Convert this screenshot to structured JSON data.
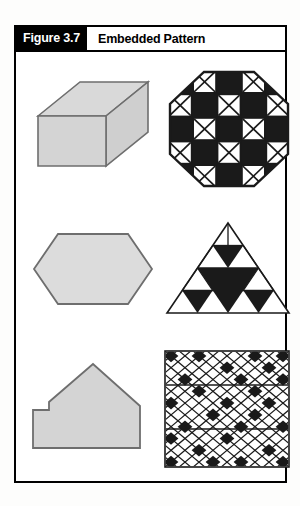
{
  "figure": {
    "number_label": "Figure 3.7",
    "title": "Embedded Pattern",
    "frame_border_color": "#000000",
    "page_background": "#fdfdfc"
  },
  "colors": {
    "ink": "#000000",
    "paper": "#ffffff",
    "shape_fill": "#d4d4d4",
    "shape_fill_light": "#dcdcdc",
    "shape_stroke": "#6e6e6e",
    "pattern_dark": "#1a1a1a",
    "pattern_light": "#ffffff"
  },
  "left_column": {
    "items": [
      {
        "name": "rectangular-box",
        "label": "3D rectangular box",
        "fill": "#d4d4d4"
      },
      {
        "name": "elongated-hexagon",
        "label": "Elongated hexagon",
        "fill": "#dcdcdc"
      },
      {
        "name": "house-pentagon",
        "label": "House-shaped pentagon",
        "fill": "#d4d4d4"
      }
    ]
  },
  "right_column": {
    "items": [
      {
        "name": "octagon-checkerboard",
        "label": "Octagon checkerboard with X cells",
        "grid_size": 5,
        "cells": [
          [
            1,
            0,
            1,
            0,
            1
          ],
          [
            0,
            1,
            0,
            1,
            0
          ],
          [
            1,
            0,
            1,
            0,
            1
          ],
          [
            0,
            1,
            0,
            1,
            0
          ],
          [
            1,
            0,
            1,
            0,
            1
          ]
        ],
        "dark_value": 1,
        "x_value": 0
      },
      {
        "name": "sierpinski-triangle",
        "label": "Sierpinski-style triangle with inverted dark triangles",
        "levels": 3,
        "dark_triangle_count": 6
      },
      {
        "name": "diamond-lattice",
        "label": "Diagonal diamond lattice with scattered dark diamonds",
        "columns": 9,
        "rows": 10,
        "horizontal_rule_count": 2,
        "dark_cells": [
          [
            0,
            0
          ],
          [
            0,
            4
          ],
          [
            0,
            7
          ],
          [
            0,
            9
          ],
          [
            1,
            2
          ],
          [
            1,
            6
          ],
          [
            2,
            0
          ],
          [
            2,
            3
          ],
          [
            2,
            8
          ],
          [
            3,
            5
          ],
          [
            3,
            9
          ],
          [
            4,
            1
          ],
          [
            4,
            4
          ],
          [
            4,
            7
          ],
          [
            5,
            2
          ],
          [
            5,
            6
          ],
          [
            5,
            9
          ],
          [
            6,
            0
          ],
          [
            6,
            3
          ],
          [
            6,
            5
          ],
          [
            7,
            1
          ],
          [
            7,
            4
          ],
          [
            7,
            8
          ],
          [
            8,
            0
          ],
          [
            8,
            2
          ],
          [
            8,
            6
          ],
          [
            8,
            9
          ]
        ]
      }
    ]
  }
}
